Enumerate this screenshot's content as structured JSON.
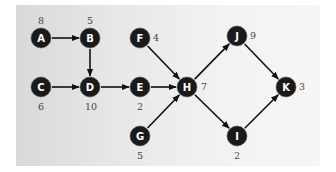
{
  "diagram": {
    "type": "directed-graph",
    "background": {
      "from": "#d9d9d9",
      "to": "#f6f6f6"
    },
    "node_color": "#1a1a1a",
    "nodes": [
      {
        "id": "A",
        "label": "A",
        "weight": "8",
        "x": 41,
        "y": 38,
        "wx": 41,
        "wy": 20
      },
      {
        "id": "B",
        "label": "B",
        "weight": "5",
        "x": 90,
        "y": 38,
        "wx": 90,
        "wy": 20
      },
      {
        "id": "C",
        "label": "C",
        "weight": "6",
        "x": 41,
        "y": 87,
        "wx": 41,
        "wy": 106
      },
      {
        "id": "D",
        "label": "D",
        "weight": "10",
        "x": 90,
        "y": 87,
        "wx": 91,
        "wy": 106
      },
      {
        "id": "E",
        "label": "E",
        "weight": "2",
        "x": 140,
        "y": 87,
        "wx": 140,
        "wy": 106
      },
      {
        "id": "F",
        "label": "F",
        "weight": "4",
        "x": 140,
        "y": 38,
        "wx": 156,
        "wy": 37
      },
      {
        "id": "G",
        "label": "G",
        "weight": "5",
        "x": 140,
        "y": 136,
        "wx": 140,
        "wy": 155
      },
      {
        "id": "H",
        "label": "H",
        "weight": "7",
        "x": 187,
        "y": 87,
        "wx": 204,
        "wy": 86
      },
      {
        "id": "J",
        "label": "J",
        "weight": "9",
        "x": 237,
        "y": 36,
        "wx": 253,
        "wy": 35
      },
      {
        "id": "I",
        "label": "I",
        "weight": "2",
        "x": 237,
        "y": 136,
        "wx": 237,
        "wy": 155
      },
      {
        "id": "K",
        "label": "K",
        "weight": "3",
        "x": 286,
        "y": 87,
        "wx": 302,
        "wy": 86
      }
    ],
    "edges": [
      {
        "from": "A",
        "to": "B"
      },
      {
        "from": "B",
        "to": "D"
      },
      {
        "from": "C",
        "to": "D"
      },
      {
        "from": "D",
        "to": "E"
      },
      {
        "from": "E",
        "to": "H"
      },
      {
        "from": "F",
        "to": "H"
      },
      {
        "from": "G",
        "to": "H"
      },
      {
        "from": "H",
        "to": "J"
      },
      {
        "from": "H",
        "to": "I"
      },
      {
        "from": "J",
        "to": "K"
      },
      {
        "from": "I",
        "to": "K"
      }
    ]
  }
}
